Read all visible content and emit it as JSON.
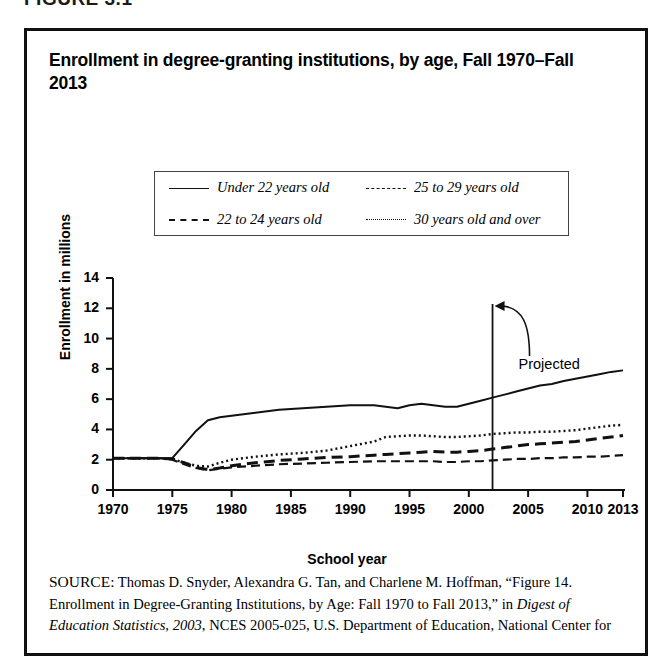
{
  "figure_label": "FIGURE 3.1",
  "title": "Enrollment in degree-granting institutions, by age, Fall 1970–Fall 2013",
  "legend": [
    {
      "label": "Under 22 years old",
      "style": "solid"
    },
    {
      "label": "25 to 29 years old",
      "style": "dashdot"
    },
    {
      "label": "22 to 24 years old",
      "style": "dashed"
    },
    {
      "label": "30 years old and over",
      "style": "dotted"
    }
  ],
  "annotation": {
    "projected_label": "Projected",
    "projected_year": 2002
  },
  "source": {
    "prefix": "SOURCE:",
    "text_1": " Thomas D. Snyder, Alexandra G. Tan, and Charlene M. Hoffman, “Figure 14. Enrollment in Degree-Granting Institutions, by Age: Fall 1970 to Fall 2013,” in ",
    "italic_1": "Digest of Education Statistics, 2003",
    "text_2": ", NCES 2005-025, U.S. Department of Education, National Center for"
  },
  "chart_data": {
    "type": "line",
    "title": "Enrollment in degree-granting institutions, by age, Fall 1970–Fall 2013",
    "xlabel": "School year",
    "ylabel": "Enrollment in millions",
    "xlim": [
      1970,
      2013
    ],
    "ylim": [
      0,
      14
    ],
    "ytick_labels": [
      "0",
      "2",
      "4",
      "6",
      "8",
      "10",
      "12",
      "14"
    ],
    "yticks": [
      0,
      2,
      4,
      6,
      8,
      10,
      12,
      14
    ],
    "xtick_labels": [
      "1970",
      "1975",
      "1980",
      "1985",
      "1990",
      "1995",
      "2000",
      "2005",
      "2010",
      "2013"
    ],
    "xticks": [
      1970,
      1975,
      1980,
      1985,
      1990,
      1995,
      2000,
      2005,
      2010,
      2013
    ],
    "grid": false,
    "legend_position": "above-plot",
    "x": [
      1970,
      1972,
      1974,
      1975,
      1976,
      1977,
      1978,
      1979,
      1980,
      1982,
      1984,
      1986,
      1988,
      1990,
      1992,
      1993,
      1994,
      1995,
      1996,
      1997,
      1998,
      1999,
      2000,
      2001,
      2002,
      2003,
      2004,
      2005,
      2006,
      2007,
      2008,
      2009,
      2010,
      2011,
      2012,
      2013
    ],
    "series": [
      {
        "name": "Under 22 years old",
        "style": "solid",
        "values": [
          2.1,
          2.1,
          2.1,
          2.1,
          3.0,
          3.9,
          4.6,
          4.8,
          4.9,
          5.1,
          5.3,
          5.4,
          5.5,
          5.6,
          5.6,
          5.5,
          5.4,
          5.6,
          5.7,
          5.6,
          5.5,
          5.5,
          5.7,
          5.9,
          6.1,
          6.3,
          6.5,
          6.7,
          6.9,
          7.0,
          7.2,
          7.35,
          7.5,
          7.65,
          7.8,
          7.9
        ]
      },
      {
        "name": "22 to 24 years old",
        "style": "dashed",
        "values": [
          2.1,
          2.1,
          2.1,
          2.05,
          1.8,
          1.5,
          1.35,
          1.45,
          1.6,
          1.8,
          1.95,
          2.05,
          2.15,
          2.2,
          2.3,
          2.35,
          2.4,
          2.45,
          2.5,
          2.55,
          2.5,
          2.5,
          2.55,
          2.6,
          2.7,
          2.8,
          2.9,
          3.0,
          3.05,
          3.1,
          3.15,
          3.2,
          3.3,
          3.4,
          3.5,
          3.6
        ]
      },
      {
        "name": "25 to 29 years old",
        "style": "dashdot",
        "values": [
          2.1,
          2.1,
          2.1,
          2.0,
          1.7,
          1.45,
          1.3,
          1.4,
          1.5,
          1.6,
          1.7,
          1.75,
          1.8,
          1.85,
          1.9,
          1.9,
          1.9,
          1.9,
          1.9,
          1.9,
          1.85,
          1.85,
          1.9,
          1.9,
          1.95,
          2.0,
          2.05,
          2.05,
          2.1,
          2.1,
          2.15,
          2.15,
          2.2,
          2.2,
          2.25,
          2.3
        ]
      },
      {
        "name": "30 years old and over",
        "style": "dotted",
        "values": [
          2.1,
          2.1,
          2.1,
          2.05,
          1.8,
          1.6,
          1.55,
          1.8,
          2.0,
          2.2,
          2.35,
          2.45,
          2.6,
          2.9,
          3.2,
          3.5,
          3.55,
          3.6,
          3.6,
          3.55,
          3.5,
          3.5,
          3.55,
          3.6,
          3.7,
          3.75,
          3.8,
          3.8,
          3.85,
          3.85,
          3.9,
          3.95,
          4.05,
          4.15,
          4.25,
          4.3
        ]
      }
    ]
  }
}
